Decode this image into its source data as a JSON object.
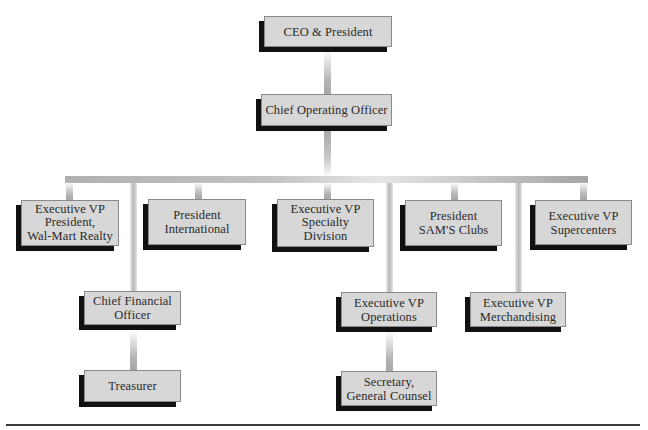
{
  "chart": {
    "type": "org-chart",
    "nodes": [
      {
        "id": "ceo",
        "label": "CEO & President"
      },
      {
        "id": "coo",
        "label": "Chief Operating Officer"
      },
      {
        "id": "evp_realty",
        "label": "Executive VP\nPresident,\nWal-Mart Realty"
      },
      {
        "id": "pres_intl",
        "label": "President\nInternational"
      },
      {
        "id": "evp_specialty",
        "label": "Executive VP\nSpecialty\nDivision"
      },
      {
        "id": "pres_sams",
        "label": "President\nSAM'S Clubs"
      },
      {
        "id": "evp_supercenters",
        "label": "Executive VP\nSupercenters"
      },
      {
        "id": "cfo",
        "label": "Chief Financial\nOfficer"
      },
      {
        "id": "treasurer",
        "label": "Treasurer"
      },
      {
        "id": "evp_operations",
        "label": "Executive VP\nOperations"
      },
      {
        "id": "evp_merch",
        "label": "Executive VP\nMerchandising"
      },
      {
        "id": "secretary",
        "label": "Secretary,\nGeneral Counsel"
      }
    ],
    "edges": [
      [
        "ceo",
        "coo"
      ],
      [
        "coo",
        "evp_realty"
      ],
      [
        "coo",
        "pres_intl"
      ],
      [
        "coo",
        "evp_specialty"
      ],
      [
        "coo",
        "pres_sams"
      ],
      [
        "coo",
        "evp_supercenters"
      ],
      [
        "coo",
        "cfo"
      ],
      [
        "coo",
        "evp_operations"
      ],
      [
        "coo",
        "evp_merch"
      ],
      [
        "cfo",
        "treasurer"
      ],
      [
        "evp_operations",
        "secretary"
      ]
    ]
  },
  "colors": {
    "box_fill": "#d7d7d7",
    "box_border": "#8a8a8a",
    "shadow": "#111111",
    "connector": "#b4b4b4",
    "text": "#2a2a2a"
  }
}
